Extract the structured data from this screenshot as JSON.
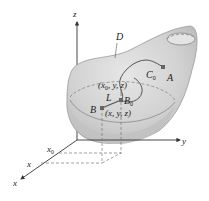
{
  "labels": {
    "z_axis": "z",
    "y_axis": "y",
    "x_axis": "x",
    "x0_tick": "x",
    "x0_sub": "0",
    "x_tick": "x",
    "region": "D",
    "curve": "C",
    "curve_sub": "0",
    "point_a": "A",
    "point_b": "B",
    "point_b0": "B",
    "point_b0_sub": "0",
    "segment": "L",
    "coord_b0": "(x",
    "coord_b0_sub": "0",
    "coord_b0_rest": ", y, z)",
    "coord_b": "(x, y, z)"
  },
  "colors": {
    "surface_fill": "#d4d4d4",
    "surface_edge": "#8a8a8a",
    "axis": "#333333",
    "dashed": "#777777",
    "point": "#666666"
  }
}
